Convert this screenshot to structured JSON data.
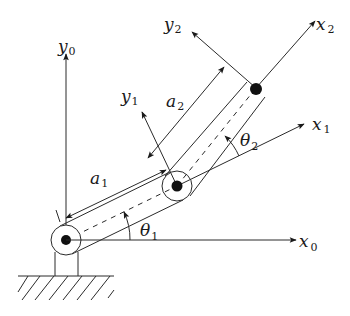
{
  "diagram": {
    "labels": {
      "x0": {
        "base": "x",
        "sub": "0"
      },
      "y0": {
        "base": "y",
        "sub": "0"
      },
      "x1": {
        "base": "x",
        "sub": "1"
      },
      "y1": {
        "base": "y",
        "sub": "1"
      },
      "x2": {
        "base": "x",
        "sub": "2"
      },
      "y2": {
        "base": "y",
        "sub": "2"
      },
      "a1": {
        "base": "a",
        "sub": "1"
      },
      "a2": {
        "base": "a",
        "sub": "2"
      },
      "theta1": {
        "base": "θ",
        "sub": "1"
      },
      "theta2": {
        "base": "θ",
        "sub": "2"
      }
    },
    "colors": {
      "stroke": "#2a2a2a",
      "joint_fill": "#111111",
      "background": "#ffffff"
    },
    "elements": [
      "base-joint",
      "elbow-joint",
      "end-effector",
      "link-1",
      "link-2",
      "ground-hatch",
      "frame-0-axes",
      "frame-1-axes",
      "frame-2-axes",
      "dimension-a1",
      "dimension-a2",
      "angle-theta1",
      "angle-theta2"
    ]
  }
}
